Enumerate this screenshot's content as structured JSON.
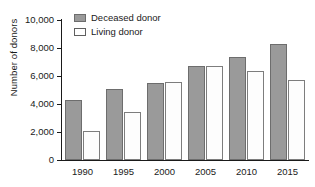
{
  "chart_data": {
    "type": "bar",
    "title": "",
    "xlabel": "",
    "ylabel": "Number of donors",
    "categories": [
      "1990",
      "1995",
      "2000",
      "2005",
      "2010",
      "2015"
    ],
    "series": [
      {
        "name": "Deceased donor",
        "values": [
          4300,
          5050,
          5500,
          6750,
          7350,
          8300
        ],
        "color": "#9a9a9a"
      },
      {
        "name": "Living donor",
        "values": [
          2050,
          3450,
          5550,
          6700,
          6350,
          5750
        ],
        "color": "#ffffff"
      }
    ],
    "ylim": [
      0,
      10000
    ],
    "ytick_values": [
      0,
      2000,
      4000,
      6000,
      8000,
      10000
    ],
    "ytick_labels": [
      "0",
      "2,000",
      "4,000",
      "6,000",
      "8,000",
      "10,000"
    ],
    "grid": false,
    "legend_position": "top-left"
  },
  "legend": {
    "items": [
      {
        "label": "Deceased donor"
      },
      {
        "label": "Living donor"
      }
    ]
  },
  "axis": {
    "y_title": "Number of donors"
  }
}
